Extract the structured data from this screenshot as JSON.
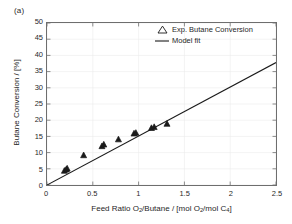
{
  "figure": {
    "panel_label": "(a)",
    "background_color": "#ffffff",
    "axis_color": "#6e6e6e",
    "grid_color": "#ebebeb"
  },
  "legend": {
    "position": "top-right-inside",
    "entries": [
      {
        "label": "Exp. Butane Conversion",
        "key": "triangle-marker",
        "marker": "triangle-up",
        "color": "#1a1a1a"
      },
      {
        "label": "Model fit",
        "key": "line-swatch",
        "marker": "line",
        "color": "#1a1a1a"
      }
    ]
  },
  "axes": {
    "x": {
      "label_parts": {
        "a": "Feed Ratio O",
        "sub1": "2",
        "b": "/Butane / [mol O",
        "sub2": "2",
        "c": "/mol C",
        "sub3": "4",
        "d": "]"
      },
      "label_plain": "Feed Ratio O2/Butane / [mol O2/mol C4]",
      "ticks": [
        "0",
        "0.5",
        "1",
        "1.5",
        "2",
        "2.5"
      ],
      "tick_values": [
        0,
        0.5,
        1,
        1.5,
        2,
        2.5
      ],
      "min": 0,
      "max": 2.5
    },
    "y": {
      "label_parts": {
        "a": "Butane Conversion / [%]"
      },
      "label_plain": "Butane Conversion / [%]",
      "ticks": [
        "0",
        "5",
        "10",
        "15",
        "20",
        "25",
        "30",
        "35",
        "40",
        "45",
        "50"
      ],
      "tick_values": [
        0,
        5,
        10,
        15,
        20,
        25,
        30,
        35,
        40,
        45,
        50
      ],
      "min": 0,
      "max": 50
    }
  },
  "chart_data": {
    "type": "scatter",
    "title": "",
    "subtitle": "",
    "xlabel": "Feed Ratio O2/Butane / [mol O2/mol C4]",
    "ylabel": "Butane Conversion / [%]",
    "xlim": [
      0,
      2.5
    ],
    "ylim": [
      0,
      50
    ],
    "grid": true,
    "legend_position": "upper right (inside axes)",
    "annotations": [
      {
        "text": "(a)",
        "position": "outside top-left of axes"
      }
    ],
    "series": [
      {
        "name": "Exp. Butane Conversion",
        "type": "scatter",
        "marker": "triangle-up",
        "color": "#1a1a1a",
        "x": [
          0.19,
          0.21,
          0.22,
          0.4,
          0.6,
          0.62,
          0.78,
          0.95,
          0.97,
          1.14,
          1.17,
          1.31
        ],
        "y": [
          4.4,
          4.8,
          5.1,
          9.2,
          12.0,
          12.5,
          14.1,
          15.9,
          16.1,
          17.6,
          17.9,
          18.9
        ]
      },
      {
        "name": "Model fit",
        "type": "line",
        "color": "#1a1a1a",
        "x": [
          0,
          2.5
        ],
        "y": [
          0,
          37.8
        ]
      }
    ]
  }
}
